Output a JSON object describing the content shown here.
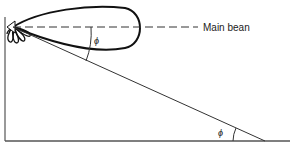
{
  "diagram": {
    "title": "",
    "labels": {
      "main_beam": "Main bean",
      "angle_top": "ϕ",
      "angle_bottom": "ϕ"
    },
    "colors": {
      "stroke": "#222222",
      "wall": "#555555",
      "background": "#ffffff"
    }
  }
}
